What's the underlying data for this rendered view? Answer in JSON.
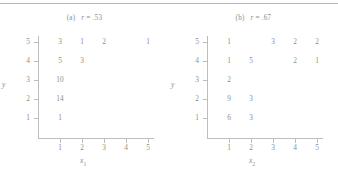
{
  "figure": {
    "panels": [
      {
        "tag": "(a)",
        "stat_label": "r",
        "stat_value": "= .53",
        "xlabel_base": "x",
        "xlabel_sub": "1",
        "ylabel": "y",
        "x_ticks": [
          "1",
          "2",
          "3",
          "4",
          "5"
        ],
        "y_ticks": [
          "1",
          "2",
          "3",
          "4",
          "5"
        ],
        "cells": [
          {
            "x": 1,
            "y": 5,
            "count": "3"
          },
          {
            "x": 2,
            "y": 5,
            "count": "1"
          },
          {
            "x": 3,
            "y": 5,
            "count": "2"
          },
          {
            "x": 5,
            "y": 5,
            "count": "1"
          },
          {
            "x": 1,
            "y": 4,
            "count": "5"
          },
          {
            "x": 2,
            "y": 4,
            "count": "3"
          },
          {
            "x": 1,
            "y": 3,
            "count": "10"
          },
          {
            "x": 1,
            "y": 2,
            "count": "14"
          },
          {
            "x": 1,
            "y": 1,
            "count": "1"
          }
        ]
      },
      {
        "tag": "(b)",
        "stat_label": "r",
        "stat_value": "= .67",
        "xlabel_base": "x",
        "xlabel_sub": "2",
        "ylabel": "y",
        "x_ticks": [
          "1",
          "2",
          "3",
          "4",
          "5"
        ],
        "y_ticks": [
          "1",
          "2",
          "3",
          "4",
          "5"
        ],
        "cells": [
          {
            "x": 1,
            "y": 5,
            "count": "1"
          },
          {
            "x": 3,
            "y": 5,
            "count": "3"
          },
          {
            "x": 4,
            "y": 5,
            "count": "2"
          },
          {
            "x": 5,
            "y": 5,
            "count": "2"
          },
          {
            "x": 1,
            "y": 4,
            "count": "1"
          },
          {
            "x": 2,
            "y": 4,
            "count": "5"
          },
          {
            "x": 4,
            "y": 4,
            "count": "2"
          },
          {
            "x": 5,
            "y": 4,
            "count": "1"
          },
          {
            "x": 1,
            "y": 3,
            "count": "2"
          },
          {
            "x": 1,
            "y": 2,
            "count": "9"
          },
          {
            "x": 2,
            "y": 2,
            "count": "3"
          },
          {
            "x": 1,
            "y": 1,
            "count": "6"
          },
          {
            "x": 2,
            "y": 1,
            "count": "3"
          }
        ]
      }
    ]
  },
  "chart_data": [
    {
      "type": "heatmap",
      "title": "(a)  r = .53",
      "xlabel": "x1",
      "ylabel": "y",
      "xlim": [
        1,
        5
      ],
      "ylim": [
        1,
        5
      ],
      "x_ticks": [
        1,
        2,
        3,
        4,
        5
      ],
      "y_ticks": [
        1,
        2,
        3,
        4,
        5
      ],
      "grid": false,
      "legend": "none",
      "annotation": "r = .53",
      "correlation": 0.53,
      "note": "Cell entries are frequency counts at each (x1, y) pair; blank cells are zero.",
      "points": [
        {
          "x": 1,
          "y": 5,
          "count": 3
        },
        {
          "x": 2,
          "y": 5,
          "count": 1
        },
        {
          "x": 3,
          "y": 5,
          "count": 2
        },
        {
          "x": 5,
          "y": 5,
          "count": 1
        },
        {
          "x": 1,
          "y": 4,
          "count": 5
        },
        {
          "x": 2,
          "y": 4,
          "count": 3
        },
        {
          "x": 1,
          "y": 3,
          "count": 10
        },
        {
          "x": 1,
          "y": 2,
          "count": 14
        },
        {
          "x": 1,
          "y": 1,
          "count": 1
        }
      ]
    },
    {
      "type": "heatmap",
      "title": "(b)  r = .67",
      "xlabel": "x2",
      "ylabel": "y",
      "xlim": [
        1,
        5
      ],
      "ylim": [
        1,
        5
      ],
      "x_ticks": [
        1,
        2,
        3,
        4,
        5
      ],
      "y_ticks": [
        1,
        2,
        3,
        4,
        5
      ],
      "grid": false,
      "legend": "none",
      "annotation": "r = .67",
      "correlation": 0.67,
      "note": "Cell entries are frequency counts at each (x2, y) pair; blank cells are zero.",
      "points": [
        {
          "x": 1,
          "y": 5,
          "count": 1
        },
        {
          "x": 3,
          "y": 5,
          "count": 3
        },
        {
          "x": 4,
          "y": 5,
          "count": 2
        },
        {
          "x": 5,
          "y": 5,
          "count": 2
        },
        {
          "x": 1,
          "y": 4,
          "count": 1
        },
        {
          "x": 2,
          "y": 4,
          "count": 5
        },
        {
          "x": 4,
          "y": 4,
          "count": 2
        },
        {
          "x": 5,
          "y": 4,
          "count": 1
        },
        {
          "x": 1,
          "y": 3,
          "count": 2
        },
        {
          "x": 1,
          "y": 2,
          "count": 9
        },
        {
          "x": 2,
          "y": 2,
          "count": 3
        },
        {
          "x": 1,
          "y": 1,
          "count": 6
        },
        {
          "x": 2,
          "y": 1,
          "count": 3
        }
      ]
    }
  ]
}
